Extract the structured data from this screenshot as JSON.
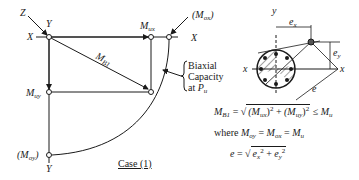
{
  "diagram": {
    "title": "Case (1)",
    "left_panel": {
      "axis_labels": {
        "z": "Z",
        "y_top": "Y",
        "x_left": "X",
        "x_right": "X",
        "y_bottom": "Y"
      },
      "points": {
        "m_ux": {
          "symbol": "M",
          "subscript": "ux"
        },
        "m_ox": {
          "symbol": "(M",
          "subscript": "ox",
          "suffix": ")"
        },
        "m_uy": {
          "symbol": "M",
          "subscript": "uy"
        },
        "m_oy": {
          "symbol": "(M",
          "subscript": "oy",
          "suffix": ")"
        },
        "m_b1": {
          "symbol": "M",
          "subscript": "B1"
        }
      },
      "annotation": {
        "line1": "Biaxial",
        "line2": "Capacity",
        "line3_prefix": "at ",
        "line3_symbol": "P",
        "line3_subscript": "u"
      },
      "case_label": "Case (1)"
    },
    "cross_section": {
      "axis_labels": {
        "y": "y",
        "x_left": "x",
        "x_right": "x"
      },
      "dimensions": {
        "ex": "e",
        "ex_sub": "x",
        "ey": "e",
        "ey_sub": "y",
        "e": "e"
      },
      "bar_count": 8
    },
    "equations": {
      "eq1": {
        "lhs": "M",
        "lhs_sub": "B1",
        "eq": " = ",
        "term1": "(M",
        "term1_sub": "ux",
        "term1_close": ")",
        "sup1": "2",
        "plus": " + ",
        "term2": "(M",
        "term2_sub": "uy",
        "term2_close": ")",
        "sup2": "2",
        "rel": " ≤ ",
        "rhs": "M",
        "rhs_sub": "u"
      },
      "eq2": {
        "prefix": "where ",
        "a": "M",
        "a_sub": "oy",
        "eq1": " = ",
        "b": "M",
        "b_sub": "ox",
        "eq2": " = ",
        "c": "M",
        "c_sub": "u"
      },
      "eq3": {
        "lhs": "e",
        "eq": " = ",
        "t1": "e",
        "t1_sub": "x",
        "sup1": "2",
        "plus": " + ",
        "t2": "e",
        "t2_sub": "y",
        "sup2": "2"
      }
    }
  }
}
